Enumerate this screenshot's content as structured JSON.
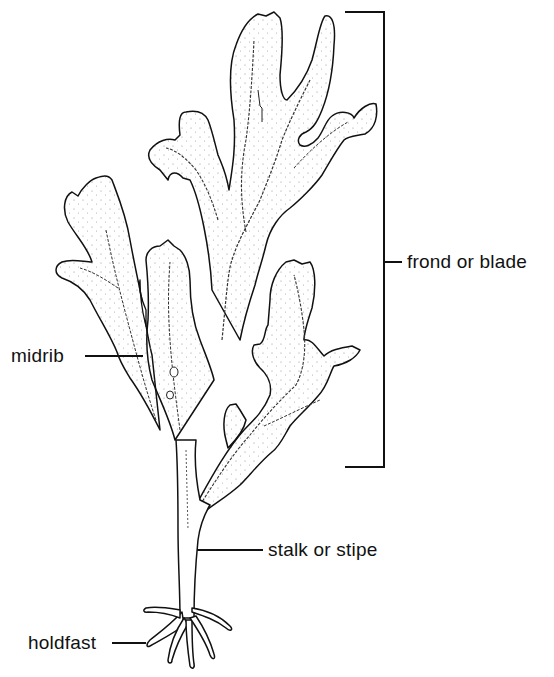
{
  "diagram": {
    "labels": [
      {
        "id": "frond",
        "text": "frond or blade",
        "target": "upper branching leafy portion (bracketed)"
      },
      {
        "id": "midrib",
        "text": "midrib",
        "target": "central vein of blade"
      },
      {
        "id": "stipe",
        "text": "stalk or stipe",
        "target": "main stem"
      },
      {
        "id": "holdfast",
        "text": "holdfast",
        "target": "root-like anchoring base"
      }
    ],
    "colors": {
      "ink": "#111111",
      "background": "#ffffff",
      "stipple": "#8a8a8a"
    }
  }
}
